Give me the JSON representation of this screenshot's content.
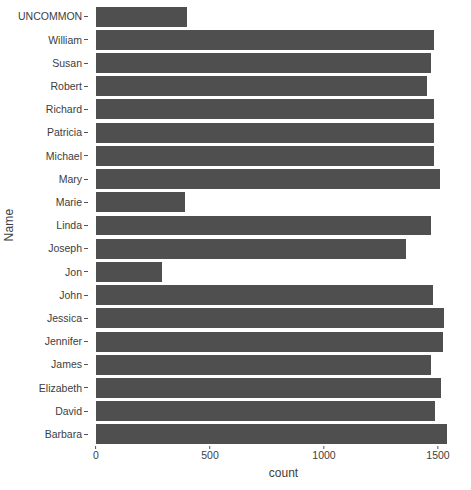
{
  "chart_data": {
    "type": "bar",
    "orientation": "horizontal",
    "title": "",
    "xlabel": "count",
    "ylabel": "Name",
    "xlim": [
      0,
      1580
    ],
    "xticks": [
      0,
      500,
      1000,
      1500
    ],
    "xticklabels": [
      "0",
      "500",
      "1000",
      "1500"
    ],
    "grid": false,
    "legend": null,
    "bar_color": "#4f4f4f",
    "background_color": "#ffffff",
    "categories": [
      "UNCOMMON",
      "William",
      "Susan",
      "Robert",
      "Richard",
      "Patricia",
      "Michael",
      "Mary",
      "Marie",
      "Linda",
      "Joseph",
      "Jon",
      "John",
      "Jessica",
      "Jennifer",
      "James",
      "Elizabeth",
      "David",
      "Barbara"
    ],
    "values": [
      400,
      1482,
      1470,
      1452,
      1482,
      1482,
      1482,
      1508,
      390,
      1470,
      1360,
      290,
      1478,
      1526,
      1522,
      1470,
      1513,
      1487,
      1540
    ]
  }
}
